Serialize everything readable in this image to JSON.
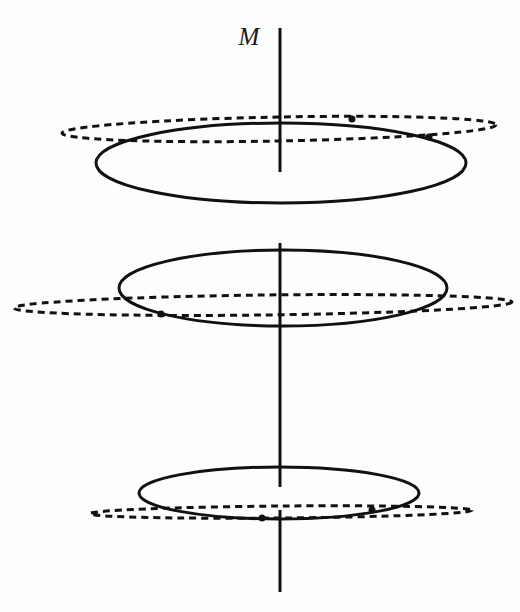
{
  "figure": {
    "background_color": "#fdfdfd",
    "ink_color": "#111111",
    "width": 520,
    "height": 612
  },
  "axis": {
    "label": "M",
    "label_x": 249,
    "label_y": 45,
    "x": 280,
    "color": "#111111",
    "stroke_width": 3,
    "segments": [
      {
        "name": "axis-segment-top",
        "y1": 28,
        "y2": 172
      },
      {
        "name": "axis-segment-middle",
        "y1": 243,
        "y2": 487
      },
      {
        "name": "axis-segment-bottom",
        "y1": 510,
        "y2": 592
      }
    ]
  },
  "orbit_groups": [
    {
      "name": "upper-orbit-pair",
      "solid": {
        "name": "upper-solid-orbit",
        "cx": 281,
        "cy": 163,
        "rx": 185,
        "ry": 40,
        "rotation": 0,
        "stroke_width": 3,
        "style": "solid"
      },
      "dashed": {
        "name": "upper-dashed-orbit",
        "cx": 279,
        "cy": 129,
        "rx": 217,
        "ry": 12,
        "rotation": -1.1,
        "stroke_width": 3,
        "dash_pattern": "7 5",
        "style": "dashed"
      },
      "nodes": [
        {
          "name": "upper-node-right",
          "cx": 429,
          "cy": 137,
          "r": 3.5
        },
        {
          "name": "upper-node-left",
          "cx": 352,
          "cy": 119,
          "r": 3.5
        }
      ]
    },
    {
      "name": "middle-orbit-pair",
      "solid": {
        "name": "middle-solid-orbit",
        "cx": 283,
        "cy": 288,
        "rx": 164,
        "ry": 38,
        "rotation": 0,
        "stroke_width": 3,
        "style": "solid"
      },
      "dashed": {
        "name": "middle-dashed-orbit",
        "cx": 263,
        "cy": 305,
        "rx": 249,
        "ry": 10,
        "rotation": -0.7,
        "stroke_width": 3,
        "dash_pattern": "7 5",
        "style": "dashed"
      },
      "nodes": [
        {
          "name": "middle-node-left",
          "cx": 161,
          "cy": 314,
          "r": 3.5
        }
      ]
    },
    {
      "name": "lower-orbit-pair",
      "solid": {
        "name": "lower-solid-orbit",
        "cx": 279,
        "cy": 493,
        "rx": 140,
        "ry": 26,
        "rotation": 0,
        "stroke_width": 3,
        "style": "solid"
      },
      "dashed": {
        "name": "lower-dashed-orbit",
        "cx": 281,
        "cy": 512,
        "rx": 191,
        "ry": 6,
        "rotation": -0.5,
        "stroke_width": 3,
        "dash_pattern": "7 5",
        "style": "dashed"
      },
      "nodes": [
        {
          "name": "lower-node-center",
          "cx": 262,
          "cy": 518,
          "r": 3.5
        },
        {
          "name": "lower-node-right",
          "cx": 372,
          "cy": 510,
          "r": 3.5
        }
      ]
    }
  ]
}
